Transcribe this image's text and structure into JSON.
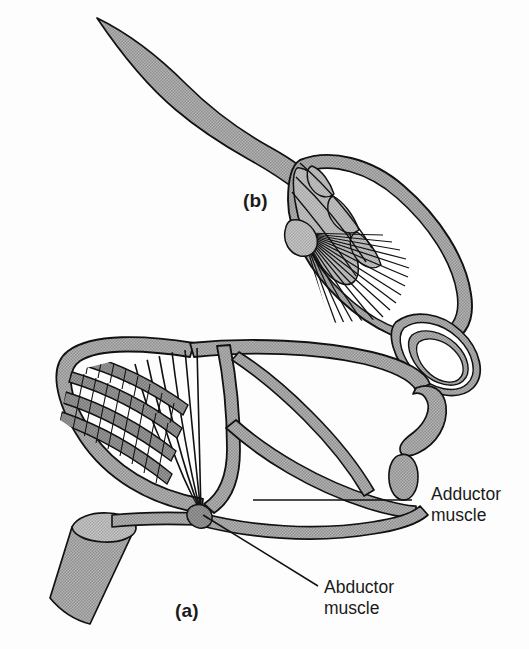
{
  "figure": {
    "kind": "anatomical-line-drawing",
    "background_color": "#fdfdfd",
    "outline_color": "#111111",
    "fill_gray": "#a9a9a9",
    "fill_gray_light": "#bdbdbd",
    "fill_white": "#ffffff",
    "panels": [
      {
        "id": "b",
        "label": "(b)",
        "label_x": 243,
        "label_y": 190,
        "note": "upper elongated tapering structure with radiating fiber fan and concentric oval ring"
      },
      {
        "id": "a",
        "label": "(a)",
        "label_x": 175,
        "label_y": 600,
        "note": "lower shell frame with fan of muscle fibers converging at a node and a cut cylindrical stalk"
      }
    ],
    "callouts": [
      {
        "id": "adductor",
        "line1": "Adductor",
        "line2": "muscle",
        "text_x": 431,
        "text_y": 484,
        "leader": {
          "x1": 412,
          "y1": 500,
          "x2": 253,
          "y2": 500
        }
      },
      {
        "id": "abductor",
        "line1": "Abductor",
        "line2": "muscle",
        "text_x": 324,
        "text_y": 577,
        "leader": {
          "x1": 318,
          "y1": 586,
          "x2": 203,
          "y2": 515
        }
      }
    ]
  }
}
